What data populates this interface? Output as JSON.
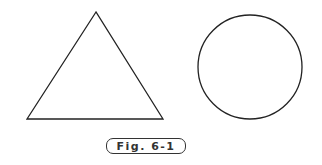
{
  "figure": {
    "caption": "Fig. 6-1",
    "stroke_color": "#222222",
    "shapes": [
      {
        "type": "triangle",
        "points": [
          [
            96,
            12
          ],
          [
            27,
            119
          ],
          [
            163,
            119
          ]
        ]
      },
      {
        "type": "circle",
        "cx": 250,
        "cy": 67,
        "r": 52
      }
    ]
  }
}
